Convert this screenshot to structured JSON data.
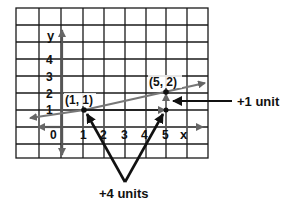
{
  "diagram": {
    "grid": {
      "columns": 9,
      "rows": 9
    },
    "axes": {
      "x_label": "x",
      "y_label": "y",
      "origin_label": "0",
      "x_ticks": [
        "1",
        "2",
        "3",
        "4",
        "5"
      ],
      "y_ticks": [
        "1",
        "2",
        "3",
        "4"
      ]
    },
    "points": [
      {
        "label": "(1, 1)",
        "x": 1,
        "y": 1
      },
      {
        "label": "(5, 2)",
        "x": 5,
        "y": 2
      }
    ],
    "annotations": {
      "rise": "+1 unit",
      "run": "+4 units"
    },
    "colors": {
      "grid": "#1a1a1a",
      "axes": "#555555",
      "line": "#777777",
      "annotation": "#111111"
    }
  }
}
